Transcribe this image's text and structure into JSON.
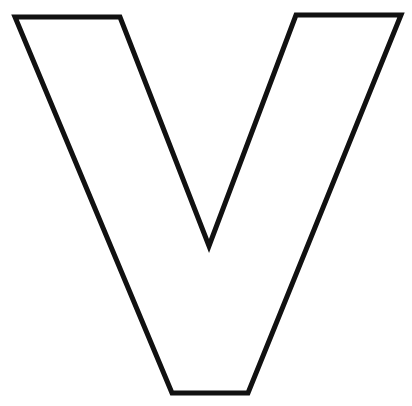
{
  "figure": {
    "letter": "V",
    "background_color": "#ffffff",
    "stroke_color": "#111111",
    "fill_color": "#ffffff",
    "stroke_width": 5
  }
}
